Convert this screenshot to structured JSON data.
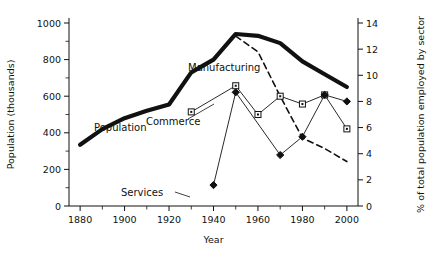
{
  "chart_data": {
    "type": "line",
    "title": "",
    "xlabel": "Year",
    "ylabel": "Population (thousands)",
    "y2label": "% of total population employed by sector",
    "xlim": [
      1875,
      2005
    ],
    "ylim": [
      0,
      1000
    ],
    "y2lim": [
      0,
      14
    ],
    "xticks": [
      1880,
      1900,
      1920,
      1940,
      1960,
      1980,
      2000
    ],
    "xtick_labels": [
      "1880",
      "1900",
      "1920",
      "1940",
      "1960",
      "1980",
      "2000"
    ],
    "xminor_step": 10,
    "yticks": [
      0,
      200,
      400,
      600,
      800,
      1000
    ],
    "ytick_labels": [
      "0",
      "200",
      "400",
      "600",
      "800",
      "1000"
    ],
    "yminor_step": 100,
    "y2ticks": [
      0,
      2,
      4,
      6,
      8,
      10,
      12,
      14
    ],
    "y2tick_labels": [
      "0",
      "2",
      "4",
      "6",
      "8",
      "10",
      "12",
      "14"
    ],
    "grid": false,
    "legend": "inline-annotations",
    "series": [
      {
        "name": "Population",
        "axis": "left",
        "style": "thick-solid",
        "color": "#111111",
        "marker": "none",
        "x": [
          1880,
          1890,
          1900,
          1910,
          1920,
          1930,
          1940,
          1950,
          1960,
          1970,
          1980,
          1990,
          2000
        ],
        "values": [
          335,
          420,
          480,
          520,
          555,
          730,
          800,
          940,
          930,
          890,
          790,
          720,
          650
        ],
        "label": "Population",
        "label_x": 1893,
        "label_y": 600
      },
      {
        "name": "Manufacturing",
        "axis": "right",
        "style": "dashed",
        "color": "#111111",
        "marker": "none",
        "x": [
          1950,
          1960,
          1970,
          1980,
          1990,
          2000
        ],
        "values": [
          13.0,
          11.8,
          8.4,
          5.2,
          4.4,
          3.4
        ],
        "label": "Manufacturing",
        "label_x": 1943,
        "label_y": 11.0
      },
      {
        "name": "Commerce",
        "axis": "right",
        "style": "thin-solid",
        "color": "#111111",
        "marker": "square",
        "x": [
          1930,
          1950,
          1960,
          1970,
          1980,
          1990,
          2000
        ],
        "values": [
          7.2,
          9.2,
          7.0,
          8.4,
          7.8,
          8.5,
          5.9
        ],
        "label": "Commerce",
        "label_x": 1920,
        "label_y": 6.6
      },
      {
        "name": "Services",
        "axis": "right",
        "style": "thin-solid",
        "color": "#111111",
        "marker": "diamond",
        "x": [
          1940,
          1950,
          1970,
          1980,
          1990,
          2000
        ],
        "values": [
          1.6,
          8.7,
          3.9,
          5.3,
          8.5,
          8.0
        ],
        "label": "Services",
        "label_x": 1930,
        "label_y": 1.6
      }
    ]
  }
}
